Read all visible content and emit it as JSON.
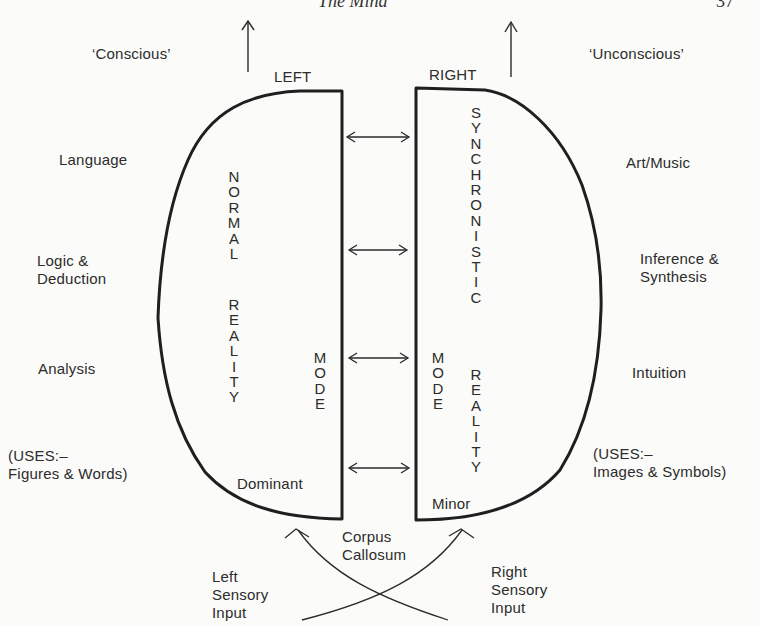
{
  "header": {
    "running_title": "The Mind",
    "page_number": "37"
  },
  "diagram": {
    "title_left": "LEFT",
    "title_right": "RIGHT",
    "top_labels": {
      "left": "‘Conscious’",
      "right": "‘Unconscious’"
    },
    "left_functions": [
      "Language",
      "Logic &\nDeduction",
      "Analysis",
      "(USES:–\nFigures & Words)"
    ],
    "right_functions": [
      "Art/Music",
      "Inference &\nSynthesis",
      "Intuition",
      "(USES:–\nImages & Symbols)"
    ],
    "left_hemisphere": {
      "vertical_text_1": "NORMAL",
      "vertical_text_2": "REALITY",
      "vertical_text_mode": "MODE",
      "label": "Dominant"
    },
    "right_hemisphere": {
      "vertical_text_1": "SYNCHRONISTIC",
      "vertical_text_2": "REALITY",
      "vertical_text_mode": "MODE",
      "label": "Minor"
    },
    "connector": {
      "label_line1": "Corpus",
      "label_line2": "Callosum",
      "double_arrow_count": 4
    },
    "inputs": {
      "left": "Left\nSensory\nInput",
      "right": "Right\nSensory\nInput"
    },
    "colors": {
      "ink": "#2a2a2a",
      "paper": "#fbfbf9"
    }
  }
}
